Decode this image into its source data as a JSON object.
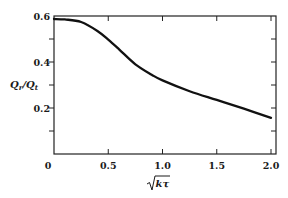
{
  "chart_data": {
    "type": "line",
    "title": "",
    "xlabel": "√(kτ)",
    "ylabel": "Qr/Qt",
    "xlim": [
      0,
      2.0
    ],
    "ylim": [
      0,
      0.6
    ],
    "x_ticks": [
      "0",
      "0.5",
      "1.0",
      "1.5",
      "2.0"
    ],
    "y_ticks": [
      "0.2",
      "0.4",
      "0.6"
    ],
    "grid": false,
    "legend": null,
    "series": [
      {
        "name": "Qr/Qt",
        "x": [
          0.0,
          0.1,
          0.25,
          0.4,
          0.5,
          0.6,
          0.75,
          0.9,
          1.0,
          1.25,
          1.5,
          1.75,
          2.0
        ],
        "y": [
          0.587,
          0.585,
          0.574,
          0.535,
          0.497,
          0.455,
          0.39,
          0.345,
          0.32,
          0.273,
          0.235,
          0.197,
          0.157
        ]
      }
    ]
  },
  "labels": {
    "y_axis_main": "Q",
    "y_axis_sub1": "r",
    "y_axis_slash": "/",
    "y_axis_main2": "Q",
    "y_axis_sub2": "t",
    "x_axis_radicand": "kτ",
    "x_zero": "0"
  },
  "colors": {
    "line": "#111111",
    "axis": "#222222"
  }
}
